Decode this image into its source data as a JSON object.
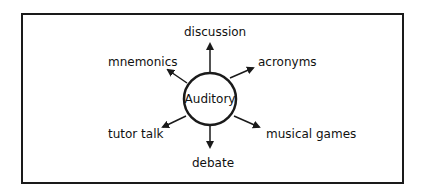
{
  "diagram": {
    "type": "hub-and-spoke",
    "center": {
      "label": "Auditory"
    },
    "spokes": [
      {
        "label": "discussion",
        "direction": "up"
      },
      {
        "label": "acronyms",
        "direction": "upper-right"
      },
      {
        "label": "musical games",
        "direction": "lower-right"
      },
      {
        "label": "debate",
        "direction": "down"
      },
      {
        "label": "tutor talk",
        "direction": "lower-left"
      },
      {
        "label": "mnemonics",
        "direction": "upper-left"
      }
    ]
  },
  "colors": {
    "stroke": "#1a1a1a",
    "background": "#ffffff",
    "text": "#111111"
  }
}
